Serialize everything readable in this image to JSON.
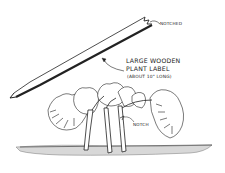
{
  "illustration": {
    "subject": "Large wooden plant label with notched plant stems",
    "labels": {
      "notched": "NOTCHED",
      "main_line1": "LARGE WOODEN",
      "main_line2": "PLANT LABEL",
      "main_line3": "(ABOUT 10\" LONG)",
      "notch": "NOTCH"
    },
    "colors": {
      "ink": "#222222",
      "background": "#ffffff",
      "soil": "#d8d8d8"
    }
  }
}
